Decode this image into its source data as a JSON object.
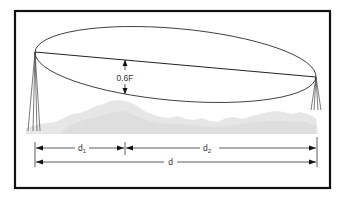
{
  "figure": {
    "type": "fresnel-zone-clearance-diagram",
    "labels": {
      "clearance": "0.6F",
      "d1_main": "d",
      "d1_sub": "1",
      "d2_main": "d",
      "d2_sub": "2",
      "d_total": "d"
    },
    "colors": {
      "frame": "#111111",
      "line": "#333333",
      "terrain": "#e4e4e4",
      "background": "#ffffff"
    },
    "geometry": {
      "frame": {
        "x": 15,
        "y": 11,
        "w": 315,
        "h": 177
      },
      "left_antenna": {
        "x": 35,
        "y": 52
      },
      "right_antenna": {
        "x": 316,
        "y": 77
      },
      "clearance_x": 125,
      "d1_end_x": 125,
      "dim_row1_y": 148,
      "dim_row2_y": 162
    }
  }
}
